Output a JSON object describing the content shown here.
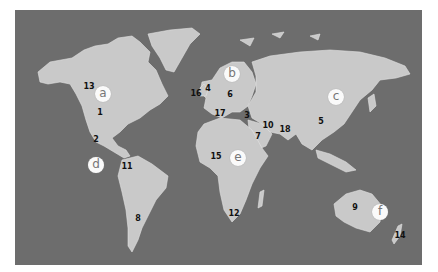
{
  "map": {
    "colors": {
      "ocean": "#6d6d6d",
      "land": "#c9c9c9",
      "border": "#e2e2e2",
      "marker_fill": "#fafafa",
      "marker_text": "#777777",
      "number_text": "#111111"
    },
    "region_markers": [
      {
        "id": "a",
        "label": "a",
        "x": 103,
        "y": 94
      },
      {
        "id": "b",
        "label": "b",
        "x": 232,
        "y": 74
      },
      {
        "id": "c",
        "label": "c",
        "x": 336,
        "y": 97
      },
      {
        "id": "d",
        "label": "d",
        "x": 96,
        "y": 165
      },
      {
        "id": "e",
        "label": "e",
        "x": 238,
        "y": 158
      },
      {
        "id": "f",
        "label": "f",
        "x": 380,
        "y": 212
      }
    ],
    "numbered_labels": [
      {
        "label": "1",
        "x": 100,
        "y": 113
      },
      {
        "label": "2",
        "x": 96,
        "y": 140
      },
      {
        "label": "3",
        "x": 247,
        "y": 116
      },
      {
        "label": "4",
        "x": 208,
        "y": 89
      },
      {
        "label": "5",
        "x": 321,
        "y": 122
      },
      {
        "label": "6",
        "x": 230,
        "y": 95
      },
      {
        "label": "7",
        "x": 258,
        "y": 137
      },
      {
        "label": "8",
        "x": 138,
        "y": 219
      },
      {
        "label": "9",
        "x": 355,
        "y": 208
      },
      {
        "label": "10",
        "x": 268,
        "y": 126
      },
      {
        "label": "11",
        "x": 127,
        "y": 167
      },
      {
        "label": "12",
        "x": 234,
        "y": 214
      },
      {
        "label": "13",
        "x": 89,
        "y": 87
      },
      {
        "label": "14",
        "x": 400,
        "y": 236
      },
      {
        "label": "15",
        "x": 216,
        "y": 157
      },
      {
        "label": "16",
        "x": 196,
        "y": 94
      },
      {
        "label": "17",
        "x": 220,
        "y": 114
      },
      {
        "label": "18",
        "x": 285,
        "y": 130
      }
    ]
  }
}
